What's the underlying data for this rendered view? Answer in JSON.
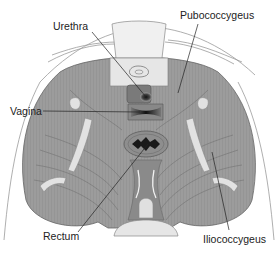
{
  "diagram": {
    "labels": [
      {
        "id": "urethra",
        "text": "Urethra",
        "x": 53,
        "y": 21,
        "target": [
          146,
          97
        ]
      },
      {
        "id": "pubococcygeus",
        "text": "Pubococcygeus",
        "x": 180,
        "y": 10,
        "target": [
          178,
          95
        ]
      },
      {
        "id": "vagina",
        "text": "Vagina",
        "x": 10,
        "y": 106,
        "target": [
          140,
          112
        ]
      },
      {
        "id": "rectum",
        "text": "Rectum",
        "x": 43,
        "y": 231,
        "target": [
          148,
          144
        ]
      },
      {
        "id": "iliococcygeus",
        "text": "Iliococcygeus",
        "x": 203,
        "y": 234,
        "target": [
          212,
          150
        ]
      }
    ],
    "colors": {
      "muscle": "#9a9a9a",
      "muscle_dark": "#6e6e6e",
      "bone": "#e2e2e2",
      "outline": "#555555",
      "leader": "#222222",
      "opening": "#1a1a1a"
    }
  }
}
